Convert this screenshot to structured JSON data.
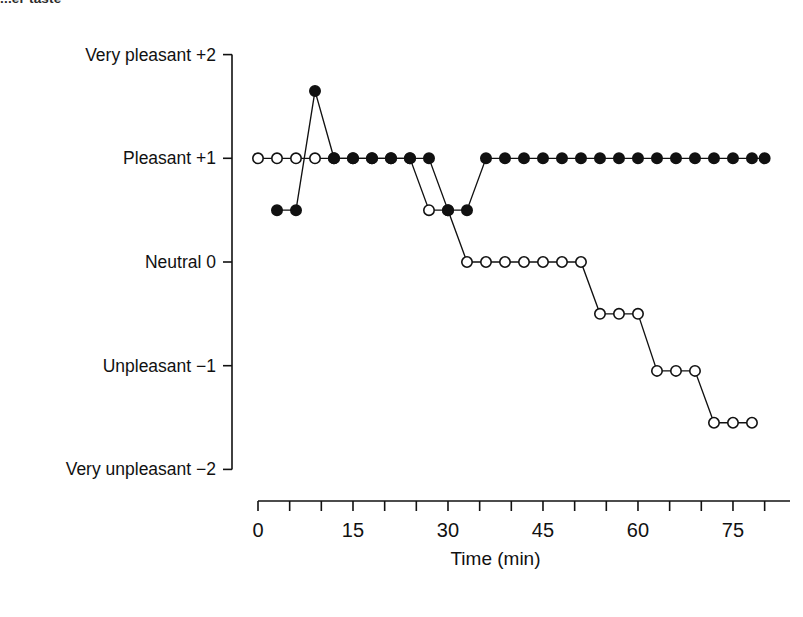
{
  "figure": {
    "top_fragment_text": "...er taste",
    "page_marker": "",
    "colors": {
      "ink": "#111111",
      "axis": "#111111",
      "marker_fill_closed": "#111111",
      "marker_fill_open": "#ffffff",
      "background": "#ffffff"
    }
  },
  "chart_data": {
    "type": "line",
    "title": "",
    "subtitle": "",
    "xlabel": "Time (min)",
    "ylabel": "",
    "xlim": [
      0,
      83
    ],
    "ylim": [
      -2,
      2
    ],
    "grid": false,
    "legend_position": "none",
    "x_ticks": [
      0,
      5,
      10,
      15,
      20,
      25,
      30,
      35,
      40,
      45,
      50,
      55,
      60,
      65,
      70,
      75,
      80
    ],
    "x_tick_labels": [
      "0",
      "",
      "",
      "15",
      "",
      "",
      "30",
      "",
      "",
      "45",
      "",
      "",
      "60",
      "",
      "",
      "75",
      ""
    ],
    "x_major_labels": [
      "0",
      "15",
      "30",
      "45",
      "60",
      "75"
    ],
    "x_major_values": [
      0,
      15,
      30,
      45,
      60,
      75
    ],
    "y_ticks": [
      2,
      1,
      0,
      -1,
      -2
    ],
    "y_tick_labels": [
      "Very pleasant  +2",
      "Pleasant  +1",
      "Neutral  0",
      "Unpleasant  −1",
      "Very unpleasant  −2"
    ],
    "series": [
      {
        "name": "open-circle-series",
        "marker": "open-circle",
        "x": [
          0,
          3,
          6,
          9,
          12,
          15,
          18,
          21,
          24,
          27,
          30,
          33,
          36,
          39,
          42,
          45,
          48,
          51,
          54,
          57,
          60,
          63,
          66,
          69,
          72,
          75,
          78
        ],
        "values": [
          1,
          1,
          1,
          1,
          1,
          1,
          1,
          1,
          1,
          0.5,
          0.5,
          0,
          0,
          0,
          0,
          0,
          0,
          0,
          -0.5,
          -0.5,
          -0.5,
          -1.05,
          -1.05,
          -1.05,
          -1.55,
          -1.55,
          -1.55
        ]
      },
      {
        "name": "closed-circle-series",
        "marker": "closed-circle",
        "x": [
          3,
          6,
          9,
          12,
          15,
          18,
          21,
          24,
          27,
          30,
          33,
          36,
          39,
          42,
          45,
          48,
          51,
          54,
          57,
          60,
          63,
          66,
          69,
          72,
          75,
          78,
          80
        ],
        "values": [
          0.5,
          0.5,
          1.65,
          1,
          1,
          1,
          1,
          1,
          1,
          0.5,
          0.5,
          1,
          1,
          1,
          1,
          1,
          1,
          1,
          1,
          1,
          1,
          1,
          1,
          1,
          1,
          1,
          1
        ]
      }
    ]
  }
}
